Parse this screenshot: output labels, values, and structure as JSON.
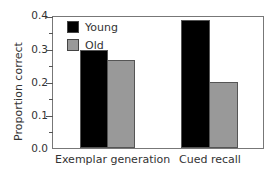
{
  "chart_data": {
    "type": "bar",
    "title": "",
    "xlabel": "",
    "ylabel": "Proportion correct",
    "ylim": [
      0.0,
      0.4
    ],
    "yticks": [
      "0.0",
      "0.1",
      "0.2",
      "0.3",
      "0.4"
    ],
    "categories": [
      "Exemplar generation",
      "Cued recall"
    ],
    "series": [
      {
        "name": "Young",
        "color": "#000000",
        "values": [
          0.3,
          0.39
        ]
      },
      {
        "name": "Old",
        "color": "#999999",
        "values": [
          0.27,
          0.2
        ]
      }
    ],
    "legend_position": "upper left",
    "grid": false
  }
}
